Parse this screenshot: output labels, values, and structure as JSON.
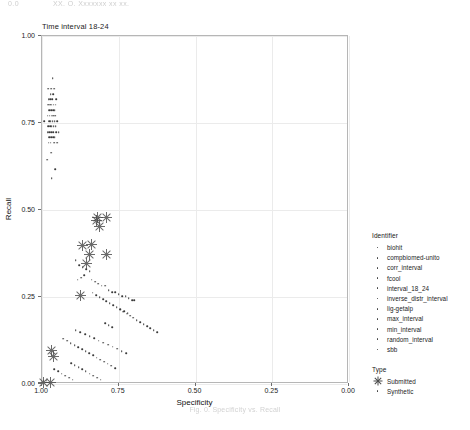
{
  "page_header": {
    "left": "0.0",
    "center": "XX. O. Xxxxxxx xx xx."
  },
  "caption": "Fig. 0. Specificity vs. Recall",
  "chart_data": {
    "type": "scatter",
    "title": "Time interval 18-24",
    "xlabel": "Specificity",
    "ylabel": "Recall",
    "xlim": [
      1.0,
      0.0
    ],
    "x_reversed": true,
    "ylim": [
      0.0,
      1.0
    ],
    "xticks": [
      1.0,
      0.75,
      0.5,
      0.25,
      0.0
    ],
    "xticklabels": [
      "1.00",
      "0.75",
      "0.50",
      "0.25",
      "0.00"
    ],
    "yticks": [
      0.0,
      0.25,
      0.5,
      0.75,
      1.0
    ],
    "yticklabels": [
      "0.00",
      "0.25",
      "0.50",
      "0.75",
      "1.00"
    ],
    "grid": true,
    "legend_position": "right",
    "legends": [
      {
        "title": "Identifier",
        "marker": "dot",
        "entries": [
          "biohit",
          "compbiomed-unito",
          "corr_interval",
          "fcool",
          "interval_18_24",
          "inverse_distr_interval",
          "lig-getalp",
          "max_interval",
          "min_interval",
          "random_interval",
          "sbb"
        ]
      },
      {
        "title": "Type",
        "entries": [
          {
            "label": "Submitted",
            "marker": "star"
          },
          {
            "label": "Synthetic",
            "marker": "dot"
          }
        ]
      }
    ],
    "series": [
      {
        "name": "Synthetic",
        "marker": "dot",
        "points": [
          [
            0.965,
            0.878
          ],
          [
            0.96,
            0.848
          ],
          [
            0.97,
            0.848
          ],
          [
            0.98,
            0.848
          ],
          [
            0.963,
            0.833
          ],
          [
            0.972,
            0.833
          ],
          [
            0.953,
            0.818
          ],
          [
            0.967,
            0.818
          ],
          [
            0.973,
            0.818
          ],
          [
            0.978,
            0.818
          ],
          [
            0.956,
            0.802
          ],
          [
            0.962,
            0.802
          ],
          [
            0.968,
            0.802
          ],
          [
            0.974,
            0.802
          ],
          [
            0.98,
            0.802
          ],
          [
            0.958,
            0.787
          ],
          [
            0.964,
            0.787
          ],
          [
            0.97,
            0.787
          ],
          [
            0.976,
            0.787
          ],
          [
            0.957,
            0.771
          ],
          [
            0.963,
            0.771
          ],
          [
            0.969,
            0.771
          ],
          [
            0.975,
            0.771
          ],
          [
            0.981,
            0.771
          ],
          [
            0.95,
            0.756
          ],
          [
            0.959,
            0.756
          ],
          [
            0.965,
            0.756
          ],
          [
            0.971,
            0.756
          ],
          [
            0.977,
            0.756
          ],
          [
            0.992,
            0.756
          ],
          [
            0.956,
            0.74
          ],
          [
            0.962,
            0.74
          ],
          [
            0.968,
            0.74
          ],
          [
            0.974,
            0.74
          ],
          [
            0.98,
            0.74
          ],
          [
            0.946,
            0.724
          ],
          [
            0.954,
            0.724
          ],
          [
            0.964,
            0.724
          ],
          [
            0.97,
            0.724
          ],
          [
            0.976,
            0.724
          ],
          [
            0.982,
            0.724
          ],
          [
            0.958,
            0.709
          ],
          [
            0.964,
            0.709
          ],
          [
            0.97,
            0.709
          ],
          [
            0.976,
            0.709
          ],
          [
            0.951,
            0.693
          ],
          [
            0.96,
            0.693
          ],
          [
            0.972,
            0.693
          ],
          [
            0.978,
            0.693
          ],
          [
            0.97,
            0.665
          ],
          [
            0.983,
            0.645
          ],
          [
            0.957,
            0.618
          ],
          [
            0.968,
            0.592
          ],
          [
            0.89,
            0.355
          ],
          [
            0.879,
            0.342
          ],
          [
            0.867,
            0.336
          ],
          [
            0.856,
            0.33
          ],
          [
            0.845,
            0.324
          ],
          [
            0.862,
            0.312
          ],
          [
            0.873,
            0.306
          ],
          [
            0.884,
            0.3
          ],
          [
            0.838,
            0.3
          ],
          [
            0.827,
            0.294
          ],
          [
            0.816,
            0.288
          ],
          [
            0.805,
            0.282
          ],
          [
            0.794,
            0.282
          ],
          [
            0.783,
            0.27
          ],
          [
            0.772,
            0.264
          ],
          [
            0.761,
            0.264
          ],
          [
            0.75,
            0.258
          ],
          [
            0.739,
            0.252
          ],
          [
            0.728,
            0.252
          ],
          [
            0.717,
            0.246
          ],
          [
            0.706,
            0.24
          ],
          [
            0.7,
            0.24
          ],
          [
            0.835,
            0.262
          ],
          [
            0.824,
            0.256
          ],
          [
            0.812,
            0.25
          ],
          [
            0.801,
            0.244
          ],
          [
            0.79,
            0.238
          ],
          [
            0.779,
            0.232
          ],
          [
            0.768,
            0.226
          ],
          [
            0.757,
            0.22
          ],
          [
            0.746,
            0.214
          ],
          [
            0.735,
            0.208
          ],
          [
            0.724,
            0.202
          ],
          [
            0.713,
            0.196
          ],
          [
            0.702,
            0.19
          ],
          [
            0.691,
            0.184
          ],
          [
            0.68,
            0.178
          ],
          [
            0.669,
            0.172
          ],
          [
            0.658,
            0.166
          ],
          [
            0.647,
            0.16
          ],
          [
            0.636,
            0.154
          ],
          [
            0.625,
            0.148
          ],
          [
            0.89,
            0.155
          ],
          [
            0.875,
            0.149
          ],
          [
            0.86,
            0.143
          ],
          [
            0.845,
            0.137
          ],
          [
            0.83,
            0.131
          ],
          [
            0.815,
            0.125
          ],
          [
            0.8,
            0.119
          ],
          [
            0.785,
            0.113
          ],
          [
            0.77,
            0.107
          ],
          [
            0.755,
            0.101
          ],
          [
            0.74,
            0.095
          ],
          [
            0.725,
            0.089
          ],
          [
            0.93,
            0.13
          ],
          [
            0.918,
            0.124
          ],
          [
            0.906,
            0.118
          ],
          [
            0.894,
            0.112
          ],
          [
            0.882,
            0.106
          ],
          [
            0.87,
            0.1
          ],
          [
            0.858,
            0.094
          ],
          [
            0.846,
            0.088
          ],
          [
            0.834,
            0.082
          ],
          [
            0.822,
            0.076
          ],
          [
            0.81,
            0.07
          ],
          [
            0.798,
            0.064
          ],
          [
            0.786,
            0.058
          ],
          [
            0.774,
            0.052
          ],
          [
            0.762,
            0.046
          ],
          [
            0.905,
            0.06
          ],
          [
            0.893,
            0.054
          ],
          [
            0.881,
            0.048
          ],
          [
            0.869,
            0.042
          ],
          [
            0.857,
            0.036
          ],
          [
            0.845,
            0.03
          ],
          [
            0.833,
            0.024
          ],
          [
            0.821,
            0.018
          ],
          [
            0.809,
            0.012
          ],
          [
            0.96,
            0.042
          ],
          [
            0.948,
            0.036
          ],
          [
            0.936,
            0.03
          ],
          [
            0.924,
            0.024
          ],
          [
            0.912,
            0.018
          ],
          [
            0.9,
            0.012
          ],
          [
            0.995,
            0.01
          ],
          [
            0.985,
            0.01
          ],
          [
            0.745,
            0.215
          ],
          [
            0.733,
            0.209
          ],
          [
            0.721,
            0.203
          ],
          [
            0.795,
            0.175
          ],
          [
            0.783,
            0.169
          ],
          [
            0.771,
            0.163
          ]
        ]
      },
      {
        "name": "Submitted",
        "marker": "star",
        "points": [
          [
            0.818,
            0.478
          ],
          [
            0.824,
            0.47
          ],
          [
            0.79,
            0.478
          ],
          [
            0.812,
            0.452
          ],
          [
            0.838,
            0.4
          ],
          [
            0.867,
            0.398
          ],
          [
            0.845,
            0.372
          ],
          [
            0.856,
            0.345
          ],
          [
            0.79,
            0.372
          ],
          [
            0.875,
            0.255
          ],
          [
            0.968,
            0.095
          ],
          [
            0.962,
            0.078
          ],
          [
            0.995,
            0.005
          ],
          [
            0.972,
            0.005
          ]
        ]
      }
    ]
  }
}
